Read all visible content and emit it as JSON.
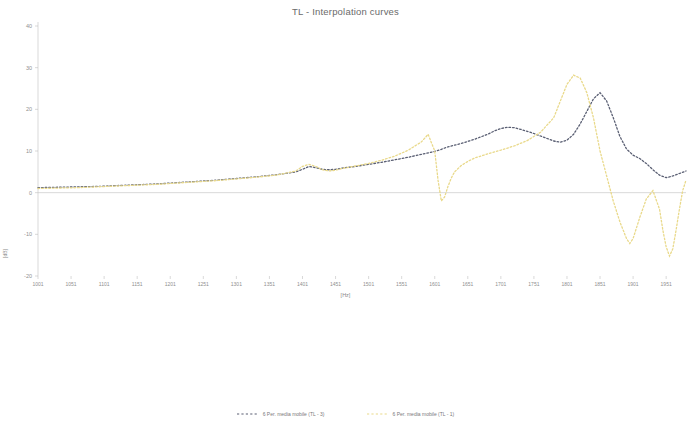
{
  "chart_data": {
    "type": "line",
    "title": "TL - Interpolation curves",
    "xlabel": "[Hz]",
    "ylabel": "[dB]",
    "xlim": [
      1001,
      1981
    ],
    "ylim": [
      -20,
      40
    ],
    "grid": false,
    "legend_position": "bottom",
    "x_ticks": [
      1001,
      1051,
      1101,
      1151,
      1201,
      1251,
      1301,
      1351,
      1401,
      1451,
      1501,
      1551,
      1601,
      1651,
      1701,
      1751,
      1801,
      1851,
      1901,
      1951
    ],
    "y_ticks": [
      40,
      30,
      20,
      10,
      0,
      -10,
      -20
    ],
    "colors": {
      "series_1": "#5a5f73",
      "series_2": "#e9d98a",
      "axis": "#bfbfbf",
      "text": "#8f8f8f"
    },
    "series": [
      {
        "name": "6 Per. media mobile (TL - 3)",
        "color": "#5a5f73",
        "style": "dotted",
        "x": [
          1001,
          1031,
          1061,
          1091,
          1121,
          1151,
          1181,
          1211,
          1241,
          1271,
          1301,
          1331,
          1361,
          1391,
          1401,
          1411,
          1421,
          1431,
          1441,
          1451,
          1461,
          1481,
          1501,
          1521,
          1541,
          1561,
          1581,
          1601,
          1611,
          1621,
          1641,
          1661,
          1681,
          1691,
          1701,
          1711,
          1721,
          1731,
          1741,
          1751,
          1761,
          1771,
          1781,
          1791,
          1801,
          1811,
          1821,
          1831,
          1841,
          1851,
          1861,
          1871,
          1881,
          1891,
          1901,
          1911,
          1921,
          1931,
          1941,
          1951,
          1961,
          1971,
          1981
        ],
        "y": [
          1.2,
          1.3,
          1.4,
          1.5,
          1.7,
          1.9,
          2.1,
          2.4,
          2.7,
          3.0,
          3.4,
          3.8,
          4.3,
          5.0,
          5.6,
          6.3,
          6.0,
          5.6,
          5.5,
          5.6,
          5.9,
          6.3,
          6.8,
          7.3,
          7.9,
          8.5,
          9.2,
          9.9,
          10.4,
          11.0,
          11.8,
          12.8,
          14.0,
          14.8,
          15.4,
          15.7,
          15.6,
          15.2,
          14.7,
          14.2,
          13.6,
          13.0,
          12.4,
          12.1,
          12.6,
          14.0,
          16.5,
          19.5,
          22.5,
          24.0,
          22.0,
          18.0,
          13.5,
          10.5,
          9.0,
          8.2,
          7.0,
          5.5,
          4.2,
          3.6,
          4.0,
          4.6,
          5.2
        ]
      },
      {
        "name": "6 Per. media mobile (TL - 1)",
        "color": "#e9d98a",
        "style": "dotted",
        "x": [
          1001,
          1031,
          1061,
          1091,
          1121,
          1151,
          1181,
          1211,
          1241,
          1271,
          1301,
          1331,
          1361,
          1391,
          1401,
          1411,
          1421,
          1431,
          1441,
          1451,
          1461,
          1481,
          1501,
          1521,
          1541,
          1561,
          1581,
          1591,
          1601,
          1606,
          1611,
          1616,
          1621,
          1626,
          1631,
          1641,
          1651,
          1661,
          1681,
          1701,
          1721,
          1741,
          1761,
          1781,
          1791,
          1801,
          1811,
          1821,
          1831,
          1841,
          1846,
          1851,
          1861,
          1871,
          1881,
          1891,
          1896,
          1901,
          1911,
          1921,
          1931,
          1941,
          1946,
          1951,
          1956,
          1961,
          1966,
          1971,
          1976,
          1981
        ],
        "y": [
          1.0,
          1.1,
          1.2,
          1.4,
          1.6,
          1.8,
          2.0,
          2.3,
          2.6,
          2.9,
          3.3,
          3.7,
          4.2,
          5.2,
          6.3,
          6.8,
          6.3,
          5.5,
          5.2,
          5.4,
          5.8,
          6.4,
          7.0,
          7.8,
          8.8,
          10.2,
          12.2,
          14.0,
          10.0,
          3.0,
          -2.0,
          -1.0,
          1.5,
          3.5,
          5.0,
          6.5,
          7.5,
          8.3,
          9.3,
          10.2,
          11.2,
          12.5,
          14.5,
          18.0,
          22.0,
          26.0,
          28.2,
          27.5,
          24.0,
          18.0,
          14.0,
          10.0,
          4.0,
          -2.0,
          -7.0,
          -11.0,
          -12.2,
          -11.0,
          -6.0,
          -1.5,
          0.5,
          -4.0,
          -9.0,
          -13.0,
          -15.2,
          -13.5,
          -9.0,
          -4.0,
          0.5,
          3.0
        ]
      }
    ]
  }
}
